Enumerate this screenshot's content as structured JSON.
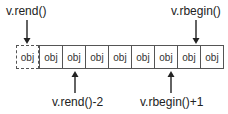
{
  "diagram": {
    "labels": {
      "rend": "v.rend()",
      "rbegin": "v.rbegin()",
      "rend_minus_2": "v.rend()-2",
      "rbegin_plus_1": "v.rbegin()+1"
    },
    "cells": [
      {
        "text": "obj",
        "style": "dashed"
      },
      {
        "text": "obj",
        "style": "solid"
      },
      {
        "text": "obj",
        "style": "solid"
      },
      {
        "text": "obj",
        "style": "solid"
      },
      {
        "text": "obj",
        "style": "solid"
      },
      {
        "text": "obj",
        "style": "solid"
      },
      {
        "text": "obj",
        "style": "solid"
      },
      {
        "text": "obj",
        "style": "solid"
      },
      {
        "text": "obj",
        "style": "solid"
      }
    ],
    "colors": {
      "line": "#333333",
      "text": "#222222",
      "background": "#ffffff"
    }
  }
}
